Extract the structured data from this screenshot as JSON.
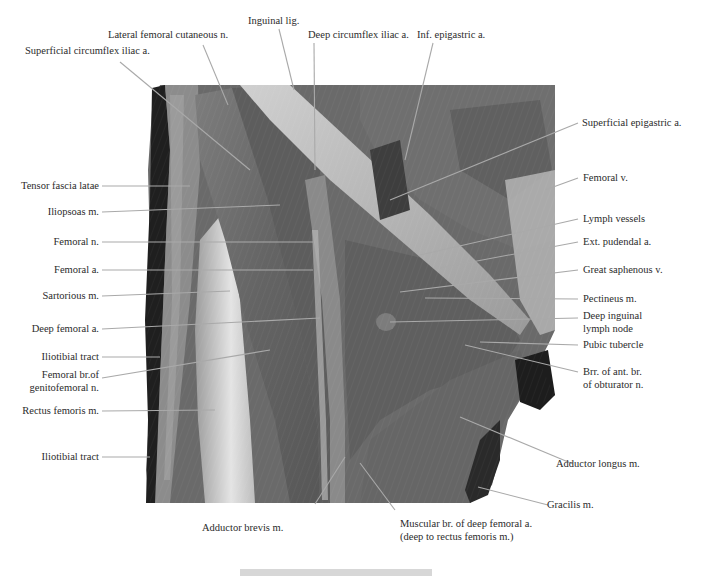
{
  "figure": {
    "type": "anatomical dissection photograph",
    "region": "anterior thigh / femoral triangle",
    "colors": {
      "background": "#ffffff",
      "label_text": "#2b2b2b",
      "leader_line": "#a9a9a9",
      "muscle_dark": "#5e5e5e",
      "muscle_mid": "#7a7a7a",
      "tendon_light": "#c9c9c9",
      "shadow": "#1e1e1e",
      "footer_bar": "#d7d7d7"
    }
  },
  "labels": {
    "top": [
      {
        "id": "superficial-circumflex-iliac",
        "text": "Superficial circumflex iliac a."
      },
      {
        "id": "lateral-femoral-cutaneous",
        "text": "Lateral femoral cutaneous n."
      },
      {
        "id": "inguinal-lig",
        "text": "Inguinal lig."
      },
      {
        "id": "deep-circumflex-iliac",
        "text": "Deep circumflex iliac a."
      },
      {
        "id": "inf-epigastric",
        "text": "Inf. epigastric a."
      }
    ],
    "left": [
      {
        "id": "tensor-fascia-latae",
        "text": "Tensor fascia latae"
      },
      {
        "id": "iliopsoas",
        "text": "Iliopsoas m."
      },
      {
        "id": "femoral-n",
        "text": "Femoral n."
      },
      {
        "id": "femoral-a",
        "text": "Femoral a."
      },
      {
        "id": "sartorious",
        "text": "Sartorious m."
      },
      {
        "id": "deep-femoral-a",
        "text": "Deep femoral a."
      },
      {
        "id": "iliotibial-tract-1",
        "text": "Iliotibial tract"
      },
      {
        "id": "femoral-br-genitofemoral",
        "line1": "Femoral br.of",
        "line2": "genitofemoral n."
      },
      {
        "id": "rectus-femoris",
        "text": "Rectus femoris m."
      },
      {
        "id": "iliotibial-tract-2",
        "text": "Iliotibial tract"
      }
    ],
    "right": [
      {
        "id": "superficial-epigastric",
        "text": "Superficial epigastric a."
      },
      {
        "id": "femoral-v",
        "text": "Femoral v."
      },
      {
        "id": "lymph-vessels",
        "text": "Lymph vessels"
      },
      {
        "id": "ext-pudendal",
        "text": "Ext. pudendal a."
      },
      {
        "id": "great-saphenous",
        "text": "Great saphenous v."
      },
      {
        "id": "pectineus",
        "text": "Pectineus m."
      },
      {
        "id": "deep-inguinal-node",
        "line1": "Deep inguinal",
        "line2": "lymph node"
      },
      {
        "id": "pubic-tubercle",
        "text": "Pubic tubercle"
      },
      {
        "id": "brr-obturator",
        "line1": "Brr. of ant. br.",
        "line2": "of obturator n."
      },
      {
        "id": "adductor-longus",
        "text": "Adductor longus m."
      },
      {
        "id": "gracilis",
        "text": "Gracilis m."
      }
    ],
    "bottom": [
      {
        "id": "adductor-brevis",
        "text": "Adductor brevis m."
      },
      {
        "id": "muscular-br-deep-femoral",
        "line1": "Muscular br. of deep femoral a.",
        "line2": "(deep to rectus femoris m.)"
      }
    ]
  }
}
